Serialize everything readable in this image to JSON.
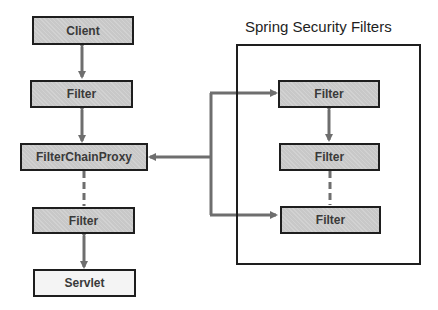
{
  "diagram": {
    "title": "Spring Security Filters",
    "left_chain": [
      {
        "id": "client",
        "label": "Client"
      },
      {
        "id": "filter-1",
        "label": "Filter"
      },
      {
        "id": "filter-chain-proxy",
        "label": "FilterChainProxy"
      },
      {
        "id": "filter-2",
        "label": "Filter"
      },
      {
        "id": "servlet",
        "label": "Servlet"
      }
    ],
    "security_filters": [
      {
        "id": "security-filter-1",
        "label": "Filter"
      },
      {
        "id": "security-filter-2",
        "label": "Filter"
      },
      {
        "id": "security-filter-3",
        "label": "Filter"
      }
    ],
    "connections": [
      {
        "from": "Client",
        "to": "Filter",
        "style": "bidirectional"
      },
      {
        "from": "Filter",
        "to": "FilterChainProxy",
        "style": "bidirectional"
      },
      {
        "from": "FilterChainProxy",
        "to": "Filter",
        "style": "dashed"
      },
      {
        "from": "Filter",
        "to": "Servlet",
        "style": "bidirectional"
      },
      {
        "from": "Spring Security Filters",
        "to": "FilterChainProxy",
        "style": "arrow"
      },
      {
        "from": "branch",
        "to": "Security Filter 1",
        "style": "arrow"
      },
      {
        "from": "branch",
        "to": "Security Filter 3",
        "style": "arrow"
      },
      {
        "from": "Security Filter 1",
        "to": "Security Filter 2",
        "style": "bidirectional"
      },
      {
        "from": "Security Filter 2",
        "to": "Security Filter 3",
        "style": "dashed"
      }
    ],
    "colors": {
      "box_fill": "#c8c8c8",
      "servlet_fill": "#f4f4f4",
      "border": "#1e1e1e",
      "connector": "#6e6e6e"
    }
  }
}
